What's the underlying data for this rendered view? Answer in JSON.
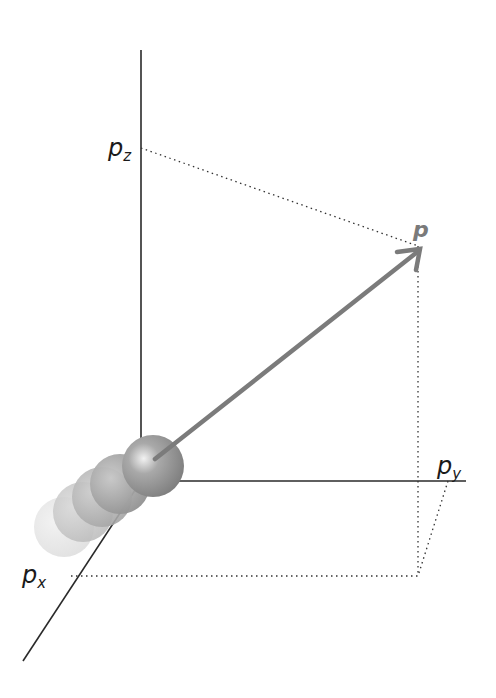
{
  "diagram": {
    "type": "3d-momentum-vector",
    "axes": {
      "z": {
        "label_base": "p",
        "label_sub": "z"
      },
      "y": {
        "label_base": "p",
        "label_sub": "y"
      },
      "x": {
        "label_base": "p",
        "label_sub": "x"
      }
    },
    "vector": {
      "label": "p",
      "color": "#7a7a7a"
    },
    "colors": {
      "axis": "#2a2a2a",
      "dotted": "#333333",
      "arrow": "#7b7b7b",
      "sphere": "#8c8c8c"
    },
    "trail_sphere_count": 5
  }
}
